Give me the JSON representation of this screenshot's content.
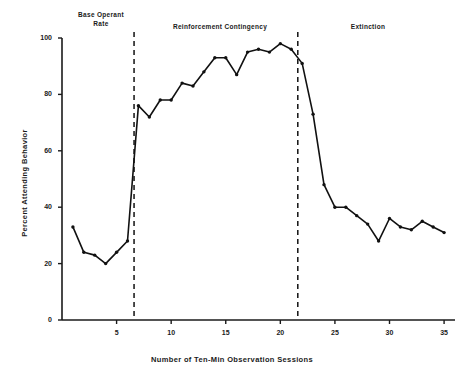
{
  "figure": {
    "background_color": "#ffffff",
    "line_color": "#111111",
    "axis_color": "#1a1a1a"
  },
  "phases": [
    {
      "name": "baseline",
      "label": "Base  Operant\nRate",
      "line1": "Base  Operant",
      "line2": "Rate"
    },
    {
      "name": "reinforcement",
      "label": "Reinforcement  Contingency",
      "line1": "Reinforcement  Contingency",
      "line2": ""
    },
    {
      "name": "extinction",
      "label": "Extinction",
      "line1": "Extinction",
      "line2": ""
    }
  ],
  "chart_data": {
    "type": "line",
    "title": "",
    "subtitle": "",
    "xlabel": "Number of Ten-Min Observation Sessions",
    "ylabel": "Percent Attending Behavior",
    "xlim": [
      0,
      36
    ],
    "ylim": [
      0,
      100
    ],
    "xticks": [
      5,
      10,
      15,
      20,
      25,
      30,
      35
    ],
    "xtick_labels": [
      "5",
      "10",
      "15",
      "20",
      "25",
      "30",
      "35"
    ],
    "yticks": [
      0,
      20,
      40,
      60,
      80,
      100
    ],
    "ytick_labels": [
      "0",
      "20",
      "40",
      "60",
      "80",
      "100"
    ],
    "grid": false,
    "legend": null,
    "legend_position": "none",
    "marker": "filled-circle",
    "x": [
      1,
      2,
      3,
      4,
      5,
      6,
      7,
      8,
      9,
      10,
      11,
      12,
      13,
      14,
      15,
      16,
      17,
      18,
      19,
      20,
      21,
      22,
      23,
      24,
      25,
      26,
      27,
      28,
      29,
      30,
      31,
      32,
      33,
      34,
      35
    ],
    "values": [
      33,
      24,
      23,
      20,
      24,
      28,
      76,
      72,
      78,
      78,
      84,
      83,
      88,
      93,
      93,
      87,
      95,
      96,
      95,
      98,
      96,
      91,
      73,
      48,
      40,
      40,
      37,
      34,
      28,
      36,
      33,
      32,
      35,
      33,
      31
    ],
    "annotations": [
      {
        "name": "phase-divider-1",
        "type": "vline",
        "x": 6.6,
        "style": "dashed"
      },
      {
        "name": "phase-divider-2",
        "type": "vline",
        "x": 21.6,
        "style": "dashed"
      }
    ]
  }
}
